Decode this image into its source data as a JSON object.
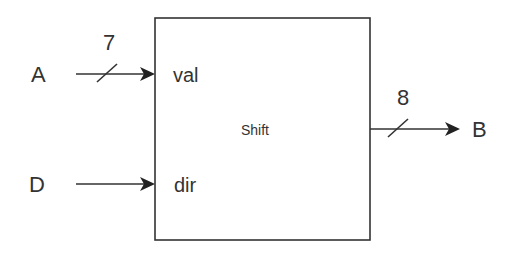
{
  "diagram": {
    "block": {
      "label": "Shift"
    },
    "inputs": [
      {
        "signal": "A",
        "port": "val",
        "width": "7"
      },
      {
        "signal": "D",
        "port": "dir"
      }
    ],
    "outputs": [
      {
        "signal": "B",
        "width": "8"
      }
    ],
    "colors": {
      "stroke": "#333333",
      "background": "#ffffff"
    }
  }
}
